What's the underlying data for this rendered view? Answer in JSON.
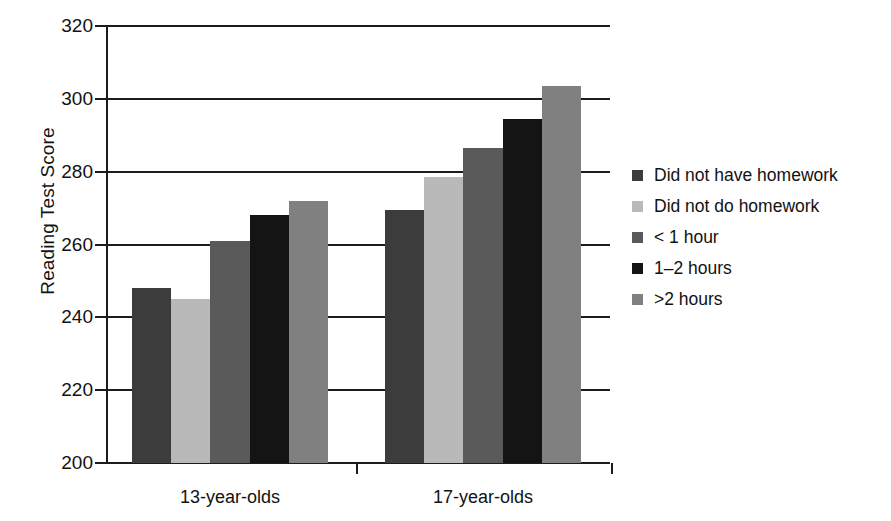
{
  "chart_data": {
    "type": "bar",
    "title": "",
    "xlabel": "",
    "ylabel": "Reading Test Score",
    "categories": [
      "13-year-olds",
      "17-year-olds"
    ],
    "ylim": [
      200,
      320
    ],
    "ytick_step": 20,
    "yticks": [
      320,
      300,
      280,
      260,
      240,
      220,
      200
    ],
    "ytick_labels": [
      "320",
      "300",
      "280",
      "260",
      "240",
      "220",
      "200"
    ],
    "grid": true,
    "grid_axis": "y",
    "legend_position": "right",
    "series": [
      {
        "name": "Did not have homework",
        "color": "#3c3c3c",
        "values": [
          248,
          269.5
        ]
      },
      {
        "name": "Did not do homework",
        "color": "#b9b9b9",
        "values": [
          245,
          278.5
        ]
      },
      {
        "name": "< 1 hour",
        "color": "#5a5a5a",
        "values": [
          261,
          286.5
        ]
      },
      {
        "name": "1–2 hours",
        "color": "#141414",
        "values": [
          268,
          294.5
        ]
      },
      {
        "name": ">2 hours",
        "color": "#808080",
        "values": [
          272,
          303.5
        ]
      }
    ]
  },
  "axis": {
    "y_title": "Reading Test Score"
  },
  "legend": {
    "items": [
      {
        "label": "Did not have homework",
        "color": "#3c3c3c"
      },
      {
        "label": "Did not do homework",
        "color": "#b9b9b9"
      },
      {
        "label": "< 1 hour",
        "color": "#5a5a5a"
      },
      {
        "label": "1–2 hours",
        "color": "#141414"
      },
      {
        "label": ">2 hours",
        "color": "#808080"
      }
    ]
  }
}
